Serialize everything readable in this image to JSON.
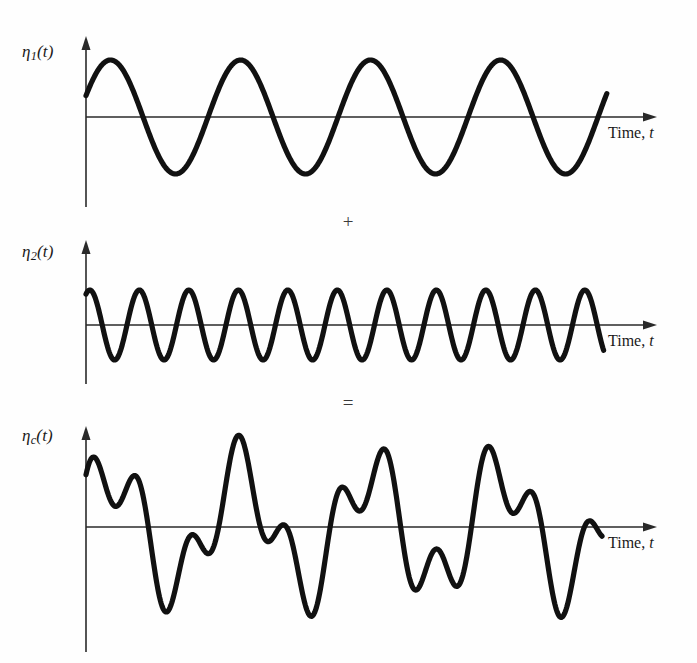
{
  "figure": {
    "background_color": "#fefefe",
    "wave_color": "#111111",
    "axis_color": "#2a2a2a"
  },
  "operators": {
    "plus": "+",
    "equals": "="
  },
  "panels": [
    {
      "id": "eta1",
      "label_eta": "η",
      "label_sub": "1",
      "label_paren": "(t)",
      "time_label_text": "Time, ",
      "time_label_var": "t"
    },
    {
      "id": "eta2",
      "label_eta": "η",
      "label_sub": "2",
      "label_paren": "(t)",
      "time_label_text": "Time, ",
      "time_label_var": "t"
    },
    {
      "id": "etac",
      "label_eta": "η",
      "label_sub": "c",
      "label_paren": "(t)",
      "time_label_text": "Time, ",
      "time_label_var": "t"
    }
  ],
  "chart_data": [
    {
      "type": "line",
      "id": "eta1",
      "title": "η₁(t)",
      "xlabel": "Time, t",
      "ylabel": "η₁(t)",
      "waveform": "sine",
      "amplitude": 57,
      "period_px": 130,
      "cycles": 4.05,
      "phase_deg": 22,
      "baseline_y": 117,
      "x_start": 86,
      "x_end": 607,
      "grid": false,
      "legend": "none"
    },
    {
      "type": "line",
      "id": "eta2",
      "title": "η₂(t)",
      "xlabel": "Time, t",
      "ylabel": "η₂(t)",
      "waveform": "sine",
      "amplitude": 35,
      "period_px": 49.5,
      "cycles": 10.5,
      "phase_deg": 62,
      "baseline_y": 325,
      "x_start": 86,
      "x_end": 604,
      "grid": false,
      "legend": "none"
    },
    {
      "type": "line",
      "id": "etac",
      "title": "η_c(t)",
      "xlabel": "Time, t",
      "ylabel": "η_c(t)",
      "waveform": "sum-of-sines",
      "components": [
        {
          "name": "η₁",
          "amplitude": 57,
          "period_px": 130,
          "phase_deg": 22
        },
        {
          "name": "η₂",
          "amplitude": 35,
          "period_px": 49.5,
          "phase_deg": 62
        }
      ],
      "amplitude_max": 92,
      "baseline_y": 527,
      "x_start": 86,
      "x_end": 602,
      "grid": false,
      "legend": "none"
    }
  ]
}
